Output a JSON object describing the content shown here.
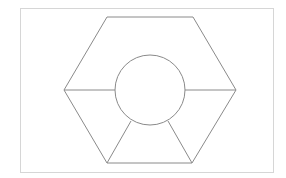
{
  "diagram": {
    "frame": {
      "x": 20,
      "y": 8,
      "width": 253,
      "height": 164,
      "stroke": "#d6d6d6"
    },
    "stroke_color": "#8a8a8a",
    "hexagon": {
      "points": [
        [
          107,
          17
        ],
        [
          193,
          17
        ],
        [
          236,
          90
        ],
        [
          192,
          163
        ],
        [
          107,
          163
        ],
        [
          64,
          90
        ]
      ]
    },
    "circle": {
      "cx": 150,
      "cy": 90,
      "r": 35
    },
    "spokes": [
      {
        "x1": 64,
        "y1": 90,
        "x2": 115,
        "y2": 90
      },
      {
        "x1": 185,
        "y1": 90,
        "x2": 236,
        "y2": 90
      },
      {
        "x1": 131,
        "y1": 121,
        "x2": 107,
        "y2": 163
      },
      {
        "x1": 168,
        "y1": 121,
        "x2": 192,
        "y2": 163
      }
    ]
  }
}
